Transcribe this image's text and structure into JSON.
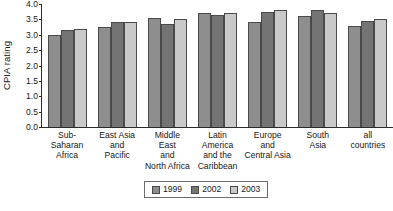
{
  "chart_data": {
    "type": "bar",
    "title": "",
    "xlabel": "",
    "ylabel": "CPIA rating",
    "ylim": [
      0.0,
      4.0
    ],
    "ytick_labels": [
      "4.0",
      "3.5",
      "3.0",
      "2.5",
      "2.0",
      "1.5",
      "1.0",
      "0.5",
      "0.0"
    ],
    "ytick_values": [
      4.0,
      3.5,
      3.0,
      2.5,
      2.0,
      1.5,
      1.0,
      0.5,
      0.0
    ],
    "grid": false,
    "legend_position": "bottom-center",
    "categories": [
      "Sub-Saharan Africa",
      "East Asia and Pacific",
      "Middle East and North Africa",
      "Latin America and the Caribbean",
      "Europe and Central Asia",
      "South Asia",
      "all countries"
    ],
    "category_lines": [
      [
        "Sub-Saharan",
        "Africa"
      ],
      [
        "East Asia",
        "and",
        "Pacific"
      ],
      [
        "Middle",
        "East",
        "and",
        "North Africa"
      ],
      [
        "Latin",
        "America",
        "and the",
        "Caribbean"
      ],
      [
        "Europe",
        "and",
        "Central Asia"
      ],
      [
        "South",
        "Asia"
      ],
      [
        "all",
        "countries"
      ]
    ],
    "series": [
      {
        "name": "1999",
        "color": "#8e8e8e",
        "values": [
          3.0,
          3.25,
          3.55,
          3.7,
          3.4,
          3.6,
          3.3
        ]
      },
      {
        "name": "2002",
        "color": "#747474",
        "values": [
          3.15,
          3.4,
          3.35,
          3.65,
          3.75,
          3.8,
          3.45
        ]
      },
      {
        "name": "2003",
        "color": "#c9c9c9",
        "values": [
          3.2,
          3.4,
          3.5,
          3.7,
          3.8,
          3.7,
          3.5
        ]
      }
    ]
  }
}
